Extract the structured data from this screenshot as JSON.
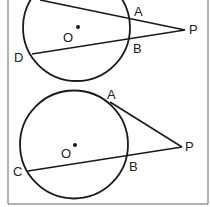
{
  "figure_top": {
    "labels": {
      "A": "A",
      "B": "B",
      "D": "D",
      "P": "P",
      "O": "O"
    }
  },
  "figure_bottom": {
    "labels": {
      "A": "A",
      "B": "B",
      "C": "C",
      "P": "P",
      "O": "O"
    }
  },
  "colors": {
    "stroke": "#1a1a1a",
    "border": "#555555",
    "background": "#ffffff"
  }
}
